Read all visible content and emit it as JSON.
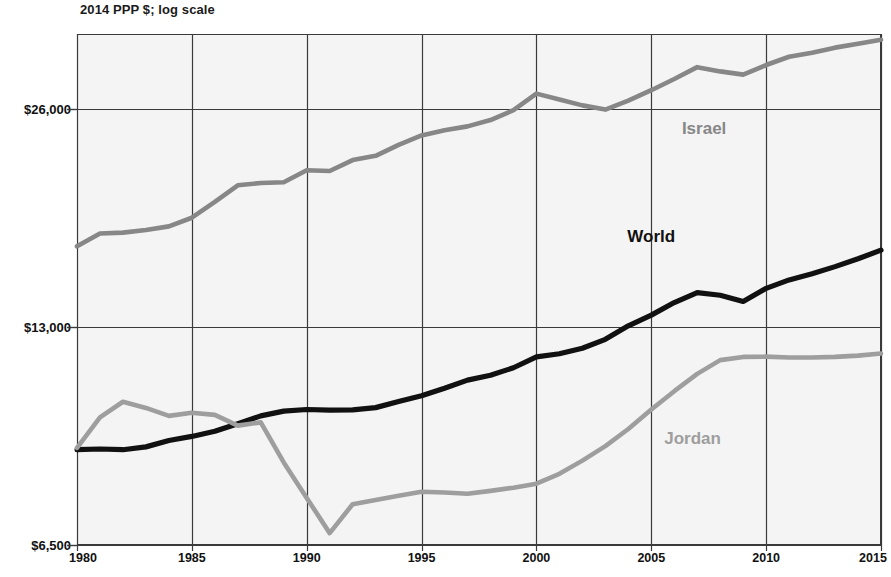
{
  "chart_data": {
    "type": "line",
    "title": "",
    "subtitle": "2014 PPP $; log scale",
    "xlabel": "",
    "ylabel": "",
    "axis_note": "2014 PPP $; log scale",
    "log_scale": true,
    "grid": true,
    "legend_position": "inline-labels",
    "colors": {
      "israel": "#878787",
      "world": "#111111",
      "jordan": "#9e9e9e",
      "plot_background": "#f4f4f4",
      "gridline": "#3a3a3a",
      "page_background": "#ffffff"
    },
    "x": [
      1980,
      1981,
      1982,
      1983,
      1984,
      1985,
      1986,
      1987,
      1988,
      1989,
      1990,
      1991,
      1992,
      1993,
      1994,
      1995,
      1996,
      1997,
      1998,
      1999,
      2000,
      2001,
      2002,
      2003,
      2004,
      2005,
      2006,
      2007,
      2008,
      2009,
      2010,
      2011,
      2012,
      2013,
      2014,
      2015
    ],
    "xlim": [
      1980,
      2015
    ],
    "ylim": [
      6500,
      33000
    ],
    "xticks": [
      1980,
      1985,
      1990,
      1995,
      2000,
      2005,
      2010,
      2015
    ],
    "xticklabels": [
      "1980",
      "1985",
      "1990",
      "1995",
      "2000",
      "2005",
      "2010",
      "2015"
    ],
    "yticks": [
      6500,
      13000,
      26000
    ],
    "yticklabels": [
      "$6,500",
      "$13,000",
      "$26,000"
    ],
    "series": [
      {
        "name": "Israel",
        "label": "Israel",
        "color": "#878787",
        "label_x": 2007.3,
        "label_y": 24400,
        "values": [
          16800,
          17500,
          17550,
          17700,
          17900,
          18400,
          19350,
          20400,
          20550,
          20600,
          21400,
          21350,
          22100,
          22400,
          23200,
          23900,
          24300,
          24600,
          25100,
          25900,
          27300,
          26800,
          26300,
          25950,
          26700,
          27600,
          28600,
          29700,
          29300,
          29000,
          29900,
          30700,
          31100,
          31600,
          32000,
          32400
        ]
      },
      {
        "name": "World",
        "label": "World",
        "color": "#111111",
        "label_x": 2005.0,
        "label_y": 17300,
        "values": [
          8800,
          8820,
          8800,
          8880,
          9060,
          9180,
          9330,
          9560,
          9800,
          9950,
          10000,
          9980,
          9990,
          10060,
          10260,
          10450,
          10700,
          10980,
          11150,
          11420,
          11820,
          11940,
          12150,
          12500,
          13050,
          13500,
          14050,
          14500,
          14380,
          14100,
          14700,
          15100,
          15400,
          15750,
          16150,
          16600
        ]
      },
      {
        "name": "Jordan",
        "label": "Jordan",
        "color": "#9e9e9e",
        "label_x": 2006.8,
        "label_y": 9100,
        "values": [
          8850,
          9750,
          10250,
          10050,
          9800,
          9900,
          9830,
          9500,
          9600,
          8450,
          7550,
          6750,
          7400,
          7500,
          7600,
          7700,
          7680,
          7650,
          7720,
          7800,
          7900,
          8150,
          8500,
          8900,
          9400,
          10000,
          10600,
          11200,
          11700,
          11820,
          11830,
          11800,
          11800,
          11820,
          11870,
          11950
        ]
      }
    ]
  }
}
